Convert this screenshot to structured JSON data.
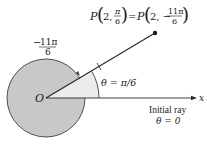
{
  "diagram": {
    "origin_label": "O",
    "axis_label": "x",
    "point_label": {
      "lhs_P": "P",
      "lhs_r": "2,",
      "lhs_num": "π",
      "lhs_den": "6",
      "equals": "=",
      "rhs_P": "P",
      "rhs_r": "2, −",
      "rhs_num": "11π",
      "rhs_den": "6"
    },
    "negative_angle_label": {
      "sign": "−",
      "num": "11π",
      "den": "6"
    },
    "theta_label": "θ = π/6",
    "initial_ray_label": "Initial ray",
    "initial_ray_theta": "θ = 0",
    "colors": {
      "circle_fill": "#c8c8c8",
      "wedge_fill": "#ebebeb",
      "stroke": "#2a2a2a",
      "background": "#ffffff"
    },
    "geometry": {
      "origin": [
        46,
        98
      ],
      "point": [
        155,
        33
      ],
      "circle_radius": 39,
      "wedge_radius": 53,
      "angle_deg": 30
    }
  }
}
